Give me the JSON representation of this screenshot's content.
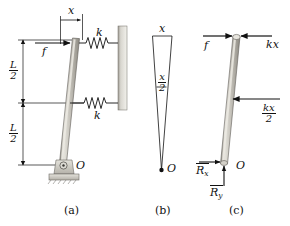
{
  "figure": {
    "type": "mechanics-free-body-diagram",
    "panels": [
      {
        "key": "a",
        "caption": "(a)",
        "description": "Rigid rod pinned at O with two springs to a rigid wall and applied force f at the top",
        "labels": {
          "displacement": "x",
          "applied_force": "f",
          "spring_top": "k",
          "spring_bottom": "k",
          "pivot": "O",
          "length_upper_num": "L",
          "length_upper_den": "2",
          "length_lower_num": "L",
          "length_lower_den": "2"
        }
      },
      {
        "key": "b",
        "caption": "(b)",
        "description": "Kinematics triangle: tip displacement x, midpoint displacement x/2, apex at pivot O",
        "labels": {
          "top_displacement": "x",
          "mid_displacement_num": "x",
          "mid_displacement_den": "2",
          "pivot": "O"
        }
      },
      {
        "key": "c",
        "caption": "(c)",
        "description": "Free-body diagram of the rod with applied force, spring forces and pin reactions",
        "labels": {
          "applied_force": "f",
          "spring_force_top": "kx",
          "spring_force_mid_num": "kx",
          "spring_force_mid_den": "2",
          "reaction_x": "R",
          "reaction_x_sub": "x",
          "reaction_y": "R",
          "reaction_y_sub": "y",
          "pivot": "O"
        }
      }
    ],
    "colors": {
      "line": "#111111",
      "rod_fill": "#b9b6ad",
      "rod_highlight": "#e2e0d9",
      "wall_fill": "#c7c5bf",
      "support_fill": "#cfccc4",
      "background": "#ffffff"
    }
  }
}
